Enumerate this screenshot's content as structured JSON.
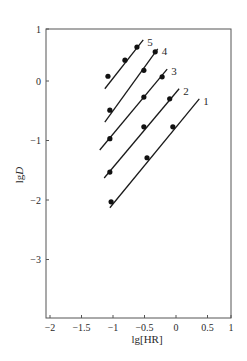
{
  "chart_data": {
    "type": "scatter",
    "title": "",
    "xlabel": "lg[HR]",
    "ylabel_prefix": "lg",
    "ylabel_italic": "D",
    "ylabel": "lgD",
    "xlim": [
      -2,
      1
    ],
    "ylim": [
      -4,
      1
    ],
    "xticks": [
      -2,
      -1.5,
      -1,
      -0.5,
      0,
      0.5,
      1
    ],
    "xtick_labels": [
      "-2",
      "-1.5",
      "-1",
      "-0.5",
      "0",
      "0.5",
      "1"
    ],
    "yticks": [
      1,
      0,
      -1,
      -2,
      -3
    ],
    "ytick_labels": [
      "1",
      "0",
      "-1",
      "-2",
      "-3"
    ],
    "grid": false,
    "legend": "inline numeric labels at line ends",
    "series": [
      {
        "name": "1",
        "points": [
          [
            -1.03,
            -2.03
          ],
          [
            -0.46,
            -1.29
          ],
          [
            -0.05,
            -0.77
          ]
        ],
        "fit_line": [
          [
            -1.05,
            -2.13
          ],
          [
            0.37,
            -0.3
          ]
        ]
      },
      {
        "name": "2",
        "points": [
          [
            -1.05,
            -1.53
          ],
          [
            -0.51,
            -0.77
          ],
          [
            -0.1,
            -0.3
          ]
        ],
        "fit_line": [
          [
            -1.14,
            -1.63
          ],
          [
            0.05,
            -0.13
          ]
        ]
      },
      {
        "name": "3",
        "points": [
          [
            -1.05,
            -0.97
          ],
          [
            -0.51,
            -0.27
          ],
          [
            -0.22,
            0.07
          ]
        ],
        "fit_line": [
          [
            -1.21,
            -1.16
          ],
          [
            -0.14,
            0.2
          ]
        ]
      },
      {
        "name": "4",
        "points": [
          [
            -1.05,
            -0.49
          ],
          [
            -0.51,
            0.18
          ],
          [
            -0.33,
            0.49
          ]
        ],
        "fit_line": [
          [
            -1.13,
            -0.69
          ],
          [
            -0.29,
            0.54
          ]
        ]
      },
      {
        "name": "5",
        "points": [
          [
            -1.08,
            0.08
          ],
          [
            -0.81,
            0.35
          ],
          [
            -0.62,
            0.57
          ]
        ],
        "fit_line": [
          [
            -1.13,
            -0.13
          ],
          [
            -0.52,
            0.69
          ]
        ]
      }
    ]
  },
  "layout": {
    "frame": {
      "left": 46,
      "top": 29,
      "right": 231,
      "bottom": 318
    },
    "x_zero_px": 176,
    "x_px_per_unit": 63,
    "y_zero_px": 81,
    "y_px_per_unit": 59.5,
    "colors": {
      "axis": "#555555",
      "line": "#1a1a1a",
      "marker": "#111111",
      "text": "#2a2a2a"
    }
  }
}
